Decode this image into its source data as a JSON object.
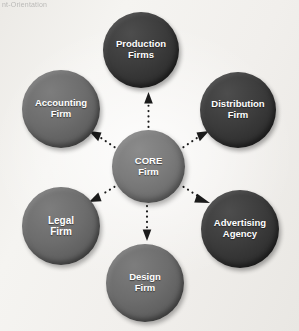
{
  "page": {
    "caption_fragment": "nt-Orientation",
    "background_color": "#f2f1ee"
  },
  "diagram": {
    "type": "hub-and-spoke",
    "hub": {
      "id": "core",
      "label": "CORE\nFirm",
      "line1": "CORE",
      "line2": "Firm",
      "shade": "core",
      "color": "#7b7b7b"
    },
    "nodes": [
      {
        "id": "production",
        "line1": "Production",
        "line2": "Firms",
        "position": "top",
        "shade": "dark",
        "color": "#3c3c3c"
      },
      {
        "id": "accounting",
        "line1": "Accounting",
        "line2": "Firm",
        "position": "top-left",
        "shade": "mid",
        "color": "#6d6d6d"
      },
      {
        "id": "distribution",
        "line1": "Distribution",
        "line2": "Firm",
        "position": "top-right",
        "shade": "dark",
        "color": "#3c3c3c"
      },
      {
        "id": "legal",
        "line1": "Legal",
        "line2": "Firm",
        "position": "bottom-left",
        "shade": "mid",
        "color": "#6d6d6d"
      },
      {
        "id": "advertising",
        "line1": "Advertising",
        "line2": "Agency",
        "position": "bottom-right",
        "shade": "dark",
        "color": "#3c3c3c"
      },
      {
        "id": "design",
        "line1": "Design",
        "line2": "Firm",
        "position": "bottom",
        "shade": "mid",
        "color": "#6d6d6d"
      }
    ],
    "connectors": {
      "style": "dotted",
      "color": "#1b1b1b",
      "direction": "from-hub-outward",
      "arrowhead": "filled-triangle",
      "edges": [
        {
          "from": "core",
          "to": "production"
        },
        {
          "from": "core",
          "to": "accounting"
        },
        {
          "from": "core",
          "to": "distribution"
        },
        {
          "from": "core",
          "to": "legal"
        },
        {
          "from": "core",
          "to": "advertising"
        },
        {
          "from": "core",
          "to": "design"
        }
      ]
    }
  }
}
